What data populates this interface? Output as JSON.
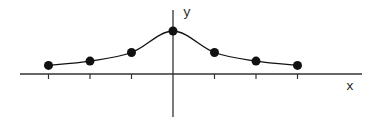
{
  "chart_data": {
    "type": "line",
    "title": "",
    "xlabel": "x",
    "ylabel": "y",
    "x": [
      -3,
      -2,
      -1,
      0,
      1,
      2,
      3
    ],
    "values": [
      0.2,
      0.3,
      0.5,
      1.0,
      0.5,
      0.3,
      0.2
    ],
    "curve": "smooth bell-shaped curve through points",
    "markers": "filled black circles",
    "grid": false,
    "legend": null,
    "tick_labels": []
  },
  "axes": {
    "x_label": "x",
    "y_label": "y"
  },
  "colors": {
    "stroke": "#111111",
    "background": "#ffffff"
  }
}
